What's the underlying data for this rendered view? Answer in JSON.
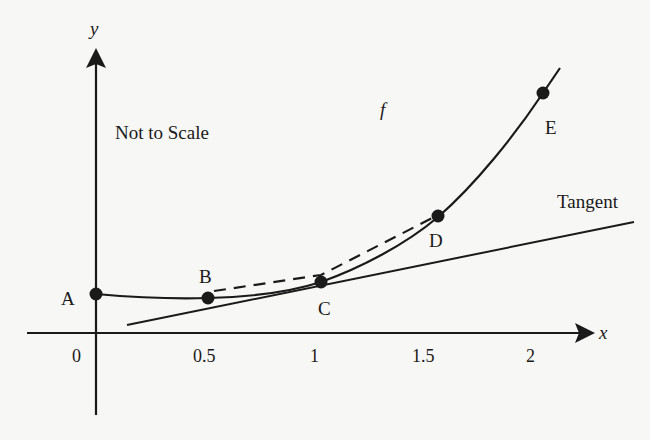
{
  "diagram": {
    "annotation": "Not to Scale",
    "function_label": "f",
    "tangent_label": "Tangent",
    "axes": {
      "x_label": "x",
      "y_label": "y",
      "x_ticks": [
        "0",
        "0.5",
        "1",
        "1.5",
        "2"
      ]
    },
    "points": [
      {
        "label": "A",
        "x": 0
      },
      {
        "label": "B",
        "x": 0.5
      },
      {
        "label": "C",
        "x": 1
      },
      {
        "label": "D",
        "x": 1.5
      },
      {
        "label": "E",
        "x": 2
      }
    ],
    "colors": {
      "ink": "#1a1a1a",
      "background": "#f7f7f5"
    }
  }
}
